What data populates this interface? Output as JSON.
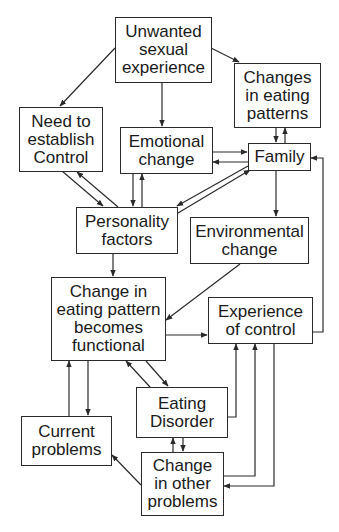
{
  "diagram": {
    "type": "flowchart",
    "colors": {
      "line": "#2a2a2a",
      "text": "#1a1a1a",
      "background": "#ffffff"
    },
    "nodes": {
      "unwanted": {
        "label": "Unwanted\nsexual\nexperience"
      },
      "changes_eating": {
        "label": "Changes\nin eating\npatterns"
      },
      "need_control": {
        "label": "Need to\nestablish\nControl"
      },
      "emotional": {
        "label": "Emotional\nchange"
      },
      "family": {
        "label": "Family"
      },
      "personality": {
        "label": "Personality\nfactors"
      },
      "environmental": {
        "label": "Environmental\nchange"
      },
      "functional": {
        "label": "Change in\neating pattern\nbecomes\nfunctional"
      },
      "experience_control": {
        "label": "Experience\nof control"
      },
      "eating_disorder": {
        "label": "Eating\nDisorder"
      },
      "current_problems": {
        "label": "Current\nproblems"
      },
      "other_problems": {
        "label": "Change\nin other\nproblems"
      }
    },
    "edges": [
      {
        "from": "Unwanted sexual experience",
        "to": "Need to establish Control"
      },
      {
        "from": "Unwanted sexual experience",
        "to": "Emotional change"
      },
      {
        "from": "Unwanted sexual experience",
        "to": "Changes in eating patterns"
      },
      {
        "from": "Changes in eating patterns",
        "to": "Family"
      },
      {
        "from": "Family",
        "to": "Changes in eating patterns"
      },
      {
        "from": "Emotional change",
        "to": "Family"
      },
      {
        "from": "Family",
        "to": "Emotional change"
      },
      {
        "from": "Need to establish Control",
        "to": "Personality factors"
      },
      {
        "from": "Personality factors",
        "to": "Need to establish Control"
      },
      {
        "from": "Emotional change",
        "to": "Personality factors"
      },
      {
        "from": "Personality factors",
        "to": "Emotional change"
      },
      {
        "from": "Family",
        "to": "Personality factors"
      },
      {
        "from": "Personality factors",
        "to": "Family"
      },
      {
        "from": "Family",
        "to": "Environmental change"
      },
      {
        "from": "Personality factors",
        "to": "Change in eating pattern becomes functional"
      },
      {
        "from": "Environmental change",
        "to": "Change in eating pattern becomes functional"
      },
      {
        "from": "Change in eating pattern becomes functional",
        "to": "Experience of control"
      },
      {
        "from": "Experience of control",
        "to": "Family"
      },
      {
        "from": "Change in eating pattern becomes functional",
        "to": "Eating Disorder"
      },
      {
        "from": "Eating Disorder",
        "to": "Change in eating pattern becomes functional"
      },
      {
        "from": "Change in eating pattern becomes functional",
        "to": "Current problems"
      },
      {
        "from": "Current problems",
        "to": "Change in eating pattern becomes functional"
      },
      {
        "from": "Eating Disorder",
        "to": "Experience of control"
      },
      {
        "from": "Eating Disorder",
        "to": "Change in other problems"
      },
      {
        "from": "Change in other problems",
        "to": "Eating Disorder"
      },
      {
        "from": "Change in other problems",
        "to": "Experience of control"
      },
      {
        "from": "Experience of control",
        "to": "Change in other problems"
      },
      {
        "from": "Change in other problems",
        "to": "Current problems"
      }
    ]
  }
}
